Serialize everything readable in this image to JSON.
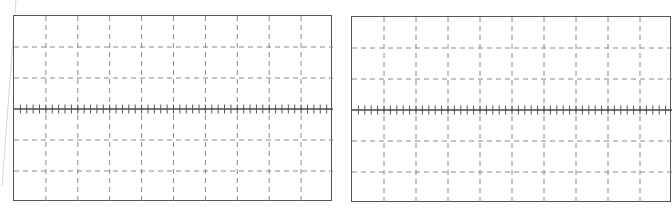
{
  "figure": {
    "panels": [
      {
        "id": "left",
        "x": 13,
        "y": 15,
        "width": 319,
        "height": 186,
        "columns": 10,
        "rows": 6,
        "minor_ticks_per_division": 5,
        "has_center_axis": true
      },
      {
        "id": "right",
        "x": 351,
        "y": 16,
        "width": 320,
        "height": 186,
        "columns": 10,
        "rows": 6,
        "minor_ticks_per_division": 5,
        "has_center_axis": true
      }
    ],
    "colors": {
      "border": "#555555",
      "grid_dashed": "#8a8a8a",
      "axis": "#444444",
      "tick": "#555555",
      "artifact": "#d6d6d6"
    }
  }
}
